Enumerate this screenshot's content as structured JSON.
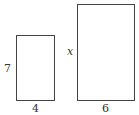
{
  "diagram": {
    "small_rectangle": {
      "height_label": "7",
      "width_label": "4"
    },
    "large_rectangle": {
      "height_label": "x",
      "width_label": "6"
    },
    "stroke_color": "#444444",
    "background_color": "#ffffff"
  }
}
